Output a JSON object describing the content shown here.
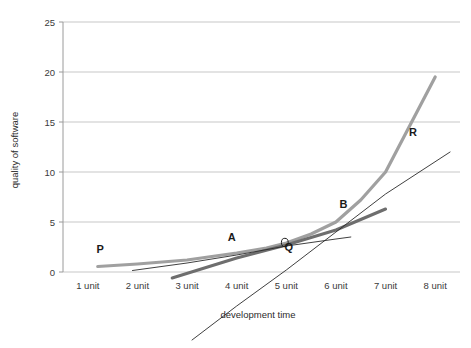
{
  "chart_data": {
    "type": "line",
    "title": "",
    "xlabel": "development time",
    "ylabel": "quality of software",
    "ylim": [
      0,
      25
    ],
    "yticks": [
      0,
      5,
      10,
      15,
      20,
      25
    ],
    "ytick_labels": [
      "0",
      "5",
      "10",
      "15",
      "20",
      "25"
    ],
    "categories": [
      "1 unit",
      "2 unit",
      "3 unit",
      "4 unit",
      "5 unit",
      "6 unit",
      "7 unit",
      "8 unit"
    ],
    "grid": true,
    "legend": "none",
    "series": [
      {
        "name": "P-R curve",
        "label_start": "P",
        "label_end": "R",
        "color": "#a0a0a0",
        "width": 3.2,
        "x": [
          1.2,
          2,
          3,
          4,
          4.6,
          5,
          5.5,
          6,
          6.5,
          7,
          8
        ],
        "values": [
          0.55,
          0.8,
          1.2,
          1.9,
          2.4,
          2.9,
          3.8,
          5.0,
          7.2,
          10.0,
          19.5
        ]
      },
      {
        "name": "A-B line",
        "label_start": "A",
        "label_end": "B",
        "color": "#6e6e6e",
        "width": 3.0,
        "x": [
          2.7,
          4,
          5,
          6,
          7.0
        ],
        "values": [
          -0.6,
          1.4,
          2.7,
          4.2,
          6.3
        ]
      },
      {
        "name": "shallow tangent",
        "label_start": "",
        "label_end": "",
        "color": "#2a2a2a",
        "width": 0.9,
        "x": [
          1.9,
          3,
          4,
          5,
          6,
          6.3
        ],
        "values": [
          0.15,
          0.9,
          1.7,
          2.6,
          3.3,
          3.5
        ]
      },
      {
        "name": "steep tangent",
        "label_start": "",
        "label_end": "",
        "color": "#2a2a2a",
        "width": 0.9,
        "x": [
          3.1,
          4,
          5,
          6,
          7,
          8.3
        ],
        "values": [
          -6.8,
          -3.4,
          0.2,
          4.0,
          7.8,
          12.0
        ]
      }
    ],
    "point_labels": [
      {
        "name": "P",
        "text": "P",
        "x": 1.25,
        "y": 1.9
      },
      {
        "name": "A",
        "text": "A",
        "x": 3.9,
        "y": 3.1
      },
      {
        "name": "Q",
        "text": "Q",
        "x": 5.05,
        "y": 2.1
      },
      {
        "name": "B",
        "text": "B",
        "x": 6.15,
        "y": 6.4
      },
      {
        "name": "R",
        "text": "R",
        "x": 7.55,
        "y": 13.6
      }
    ],
    "marker": {
      "name": "Q-point",
      "x": 4.97,
      "y": 2.95
    }
  },
  "colors": {
    "grid": "#b9b9b9",
    "axis": "#9a9a9a",
    "text": "#3a3a3a",
    "background": "#ffffff"
  }
}
